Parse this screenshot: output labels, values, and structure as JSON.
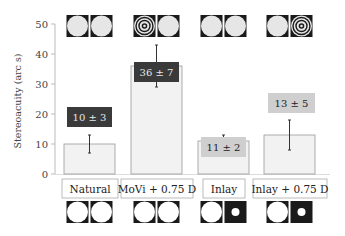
{
  "chart_data": {
    "type": "bar",
    "title": "",
    "xlabel": "",
    "ylabel": "Stereoacuity (arc s)",
    "ylim": [
      0,
      50
    ],
    "yticks": [
      0,
      10,
      20,
      30,
      40,
      50
    ],
    "grid": false,
    "legend": null,
    "categories": [
      "Natural",
      "MoVi + 0.75 D",
      "Inlay",
      "Inlay + 0.75 D"
    ],
    "values": [
      10,
      36,
      11,
      13
    ],
    "errors": [
      3,
      7,
      2,
      5
    ],
    "annotations": [
      "10 ± 3",
      "36 ± 7",
      "11 ± 2",
      "13 ± 5"
    ],
    "annotation_style": [
      "dark",
      "dark",
      "light",
      "light"
    ],
    "top_icons": [
      [
        "disc",
        "disc"
      ],
      [
        "rings",
        "disc"
      ],
      [
        "disc",
        "disc"
      ],
      [
        "disc",
        "rings"
      ]
    ],
    "bottom_icons": [
      [
        "disc",
        "disc"
      ],
      [
        "disc",
        "disc"
      ],
      [
        "disc",
        "pinhole"
      ],
      [
        "disc",
        "pinhole"
      ]
    ]
  },
  "colors": {
    "bar_fill": "#f2f2f2",
    "bar_stroke": "#999999",
    "dark_label": "#3a3a3a",
    "light_label": "#cfcfcf",
    "icon_bg": "#1a1a1a",
    "icon_disc_top": "#e6e6e6",
    "icon_disc_bottom": "#ffffff"
  }
}
